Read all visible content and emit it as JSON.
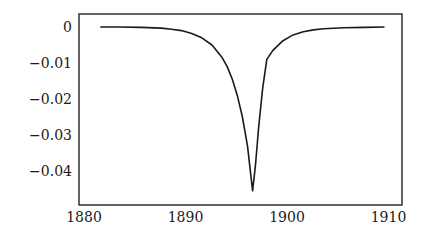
{
  "chart_data": {
    "type": "line",
    "title": "",
    "xlabel": "",
    "ylabel": "",
    "xlim": [
      1880,
      1911
    ],
    "ylim": [
      -0.0485,
      0.0035
    ],
    "grid": false,
    "legend": null,
    "x_ticks": [
      1880,
      1890,
      1900,
      1910
    ],
    "x_tick_labels": [
      "1880",
      "1890",
      "1900",
      "1910"
    ],
    "y_ticks": [
      0,
      -0.01,
      -0.02,
      -0.03,
      -0.04
    ],
    "y_tick_labels": [
      "0",
      "−0.01",
      "−0.02",
      "−0.03",
      "−0.04"
    ],
    "series": [
      {
        "name": "curve",
        "color": "#1a1a1a",
        "x": [
          1882,
          1884,
          1886,
          1888,
          1889,
          1890,
          1891,
          1892,
          1893,
          1894,
          1894.5,
          1895,
          1895.5,
          1896,
          1896.5,
          1897,
          1897.3,
          1897.6,
          1898,
          1898.4,
          1899,
          1900,
          1901,
          1902,
          1903,
          1904,
          1906,
          1908,
          1910
        ],
        "y": [
          0,
          0,
          -0.0001,
          -0.0003,
          -0.0006,
          -0.001,
          -0.0018,
          -0.003,
          -0.005,
          -0.0085,
          -0.011,
          -0.0145,
          -0.019,
          -0.025,
          -0.033,
          -0.0455,
          -0.038,
          -0.028,
          -0.017,
          -0.009,
          -0.0065,
          -0.0038,
          -0.0022,
          -0.0013,
          -0.0008,
          -0.0005,
          -0.0002,
          -0.0001,
          0
        ]
      }
    ]
  }
}
